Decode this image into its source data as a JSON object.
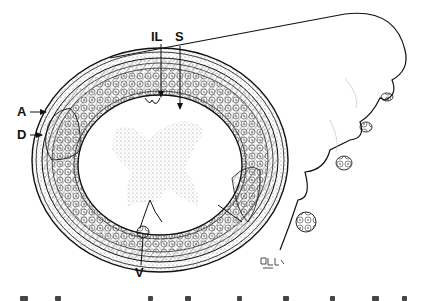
{
  "figure": {
    "type": "anatomical-cross-section",
    "labels": {
      "IL": "IL",
      "S": "S",
      "A": "A",
      "D": "D",
      "V": "V"
    },
    "signature": "artist-signature",
    "caption_visible": false
  },
  "colors": {
    "ink": "#111111",
    "stipple": "#9a9a9a",
    "background": "#ffffff"
  }
}
